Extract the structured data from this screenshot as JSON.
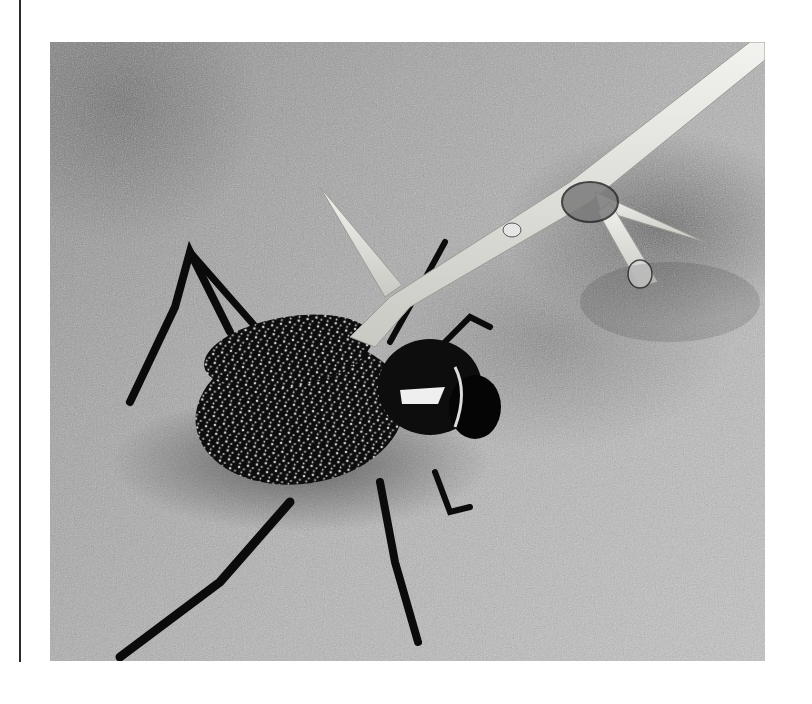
{
  "page": {
    "type": "printed-page-photo",
    "margin_rule": {
      "color": "#2a2a2a"
    }
  },
  "figure": {
    "alt": "Black-and-white photograph of a speckled desert beetle standing on sand beneath a pale thorny twig bearing water droplets",
    "colors": {
      "sand_light": "#c4c4c4",
      "sand_dark": "#8a8a8a",
      "beetle": "#0d0d0d",
      "beetle_speckle": "#d8d8d8",
      "thorn": "#e6e6e0"
    }
  }
}
